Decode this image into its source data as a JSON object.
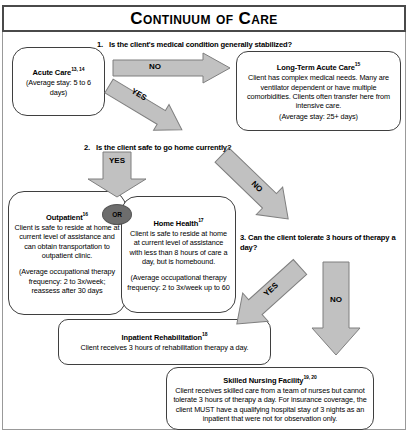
{
  "title": "Continuum of Care",
  "colors": {
    "arrow_fill": "#c1c1c1",
    "arrow_stroke": "#7f7f7f",
    "or_fill": "#6d6d6d",
    "box_border": "#3f3f3f",
    "title_border": "#4a4a4a",
    "page_border": "#999999"
  },
  "questions": {
    "q1": {
      "number": "1.",
      "text": "Is the client's medical condition generally stabilized?"
    },
    "q2": {
      "number": "2.",
      "text": "Is the client safe to go home currently?"
    },
    "q3": {
      "number": "3.",
      "text": "Can the client tolerate 3 hours of therapy a day?"
    }
  },
  "nodes": {
    "acute_care": {
      "title": "Acute Care",
      "ref": "13, 14",
      "note": "(Average stay: 5 to 6 days)"
    },
    "long_term_acute_care": {
      "title": "Long-Term Acute Care",
      "ref": "15",
      "body": "Client has complex medical needs. Many are ventilator dependent or have multiple comorbidities. Clients often transfer here from intensive care.",
      "note": "(Average stay: 25+ days)"
    },
    "outpatient": {
      "title": "Outpatient",
      "ref": "16",
      "body": "Client is safe to reside at home at current level of assistance and can obtain transportation to outpatient clinic.",
      "note": "(Average occupational therapy frequency: 2 to 3x/week; reassess after 30 days"
    },
    "home_health": {
      "title": "Home Health",
      "ref": "17",
      "body": "Client is safe to reside at home at current level of assistance with less than 8 hours of care a day, but is homebound.",
      "note": "(Average occupational therapy frequency: 2 to 3x/week up to 60"
    },
    "inpatient_rehabilitation": {
      "title": "Inpatient Rehabilitation",
      "ref": "18",
      "body": "Client receives 3 hours of rehabilitation therapy a day."
    },
    "skilled_nursing_facility": {
      "title": "Skilled Nursing Facility",
      "ref": "19, 20",
      "body": "Client receives skilled care from a team of nurses but cannot tolerate 3 hours of therapy a day. For insurance coverage, the client MUST have a qualifying hospital stay of 3 nights as an inpatient that were not for observation only."
    }
  },
  "connectors": {
    "or_label": "OR",
    "q1_no": "NO",
    "q1_yes": "YES",
    "q2_yes": "YES",
    "q2_no": "NO",
    "q3_yes": "YES",
    "q3_no": "NO"
  }
}
